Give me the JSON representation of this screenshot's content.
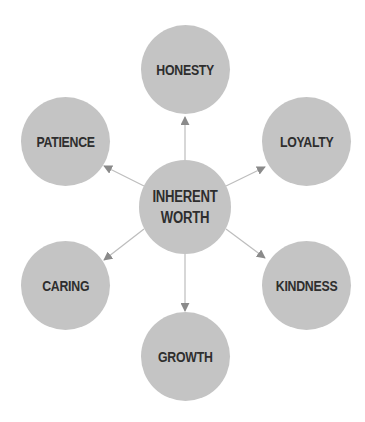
{
  "diagram": {
    "type": "hub-and-spoke",
    "colors": {
      "node_fill": "#c4c4c4",
      "label_text": "#2e2e2e",
      "connector": "#bdbdbd",
      "arrowhead": "#8a8a8a",
      "background": "#ffffff"
    },
    "center": {
      "label_line1": "INHERENT",
      "label_line2": "WORTH"
    },
    "nodes": [
      {
        "id": "honesty",
        "label": "HONESTY",
        "position": "top"
      },
      {
        "id": "loyalty",
        "label": "LOYALTY",
        "position": "upper-right"
      },
      {
        "id": "kindness",
        "label": "KINDNESS",
        "position": "lower-right"
      },
      {
        "id": "growth",
        "label": "GROWTH",
        "position": "bottom"
      },
      {
        "id": "caring",
        "label": "CARING",
        "position": "lower-left"
      },
      {
        "id": "patience",
        "label": "PATIENCE",
        "position": "upper-left"
      }
    ],
    "edges": [
      {
        "from": "center",
        "to": "honesty"
      },
      {
        "from": "center",
        "to": "loyalty"
      },
      {
        "from": "center",
        "to": "kindness"
      },
      {
        "from": "center",
        "to": "growth"
      },
      {
        "from": "center",
        "to": "caring"
      },
      {
        "from": "center",
        "to": "patience"
      }
    ]
  }
}
